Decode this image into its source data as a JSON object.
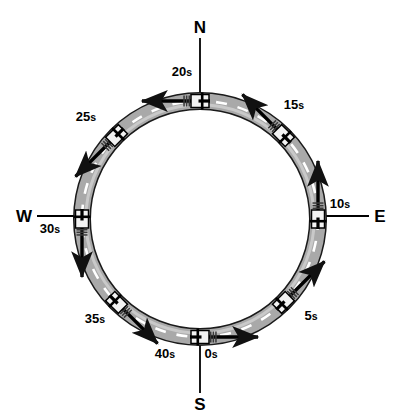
{
  "figure": {
    "type": "physics-diagram",
    "background_color": "#ffffff",
    "ink_color": "#000000",
    "track": {
      "center": {
        "x": 200,
        "y": 219
      },
      "centerline_radius": 118,
      "road_width": 16,
      "road_fill_color": "#a9a9a9",
      "road_edge_color": "#1a1a1a",
      "centerline_color": "#ffffff",
      "centerline_style": "dashed"
    },
    "motion_direction": "counterclockwise",
    "compass_labels": [
      {
        "name": "north-label",
        "text": "N",
        "x": 200,
        "y": 27,
        "leader": {
          "x1": 200,
          "y1": 38,
          "x2": 200,
          "y2": 95
        }
      },
      {
        "name": "east-label",
        "text": "E",
        "x": 380,
        "y": 216,
        "leader": {
          "x1": 369,
          "y1": 216,
          "x2": 316,
          "y2": 216
        }
      },
      {
        "name": "south-label",
        "text": "S",
        "x": 200,
        "y": 404,
        "leader": {
          "x1": 200,
          "y1": 393,
          "x2": 200,
          "y2": 341
        }
      },
      {
        "name": "west-label",
        "text": "W",
        "x": 24,
        "y": 216,
        "leader": {
          "x1": 37,
          "y1": 216,
          "x2": 86,
          "y2": 216
        }
      }
    ],
    "time_markers": [
      {
        "name": "marker-0s",
        "label": "0",
        "unit": "s",
        "angle_deg": 90,
        "label_x": 211,
        "label_y": 353,
        "car_x": 200,
        "car_y": 337,
        "arrow_dir_deg": 0
      },
      {
        "name": "marker-5s",
        "label": "5",
        "unit": "s",
        "angle_deg": 45,
        "label_x": 311,
        "label_y": 315,
        "car_x": 283,
        "car_y": 302,
        "arrow_dir_deg": -45
      },
      {
        "name": "marker-10s",
        "label": "10",
        "unit": "s",
        "angle_deg": 0,
        "label_x": 340,
        "label_y": 203,
        "car_x": 318,
        "car_y": 219,
        "arrow_dir_deg": -90
      },
      {
        "name": "marker-15s",
        "label": "15",
        "unit": "s",
        "angle_deg": -45,
        "label_x": 294,
        "label_y": 104,
        "car_x": 283,
        "car_y": 136,
        "arrow_dir_deg": -135
      },
      {
        "name": "marker-20s",
        "label": "20",
        "unit": "s",
        "angle_deg": -90,
        "label_x": 182,
        "label_y": 71,
        "car_x": 200,
        "car_y": 101,
        "arrow_dir_deg": 180
      },
      {
        "name": "marker-25s",
        "label": "25",
        "unit": "s",
        "angle_deg": -135,
        "label_x": 86,
        "label_y": 116,
        "car_x": 117,
        "car_y": 136,
        "arrow_dir_deg": 135
      },
      {
        "name": "marker-30s",
        "label": "30",
        "unit": "s",
        "angle_deg": 180,
        "label_x": 50,
        "label_y": 228,
        "car_x": 82,
        "car_y": 219,
        "arrow_dir_deg": 90
      },
      {
        "name": "marker-35s",
        "label": "35",
        "unit": "s",
        "angle_deg": 135,
        "label_x": 95,
        "label_y": 318,
        "car_x": 117,
        "car_y": 302,
        "arrow_dir_deg": 45
      },
      {
        "name": "marker-40s",
        "label": "40",
        "unit": "s",
        "angle_deg": 90,
        "label_x": 165,
        "label_y": 353,
        "car_x": 200,
        "car_y": 337,
        "arrow_dir_deg": 0
      }
    ]
  }
}
